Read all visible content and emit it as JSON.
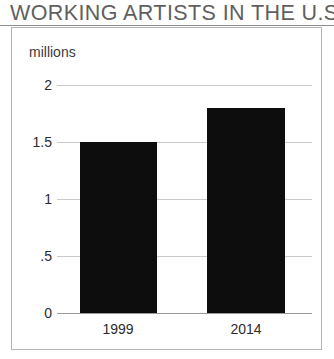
{
  "chart_data": {
    "type": "bar",
    "title": "WORKING ARTISTS IN THE U.S.",
    "subtitle": "",
    "unit_label": "millions",
    "xlabel": "",
    "ylabel": "millions",
    "categories": [
      "1999",
      "2014"
    ],
    "values": [
      1.5,
      1.8
    ],
    "series": [
      {
        "name": "Working artists",
        "values": [
          1.5,
          1.8
        ]
      }
    ],
    "ylim": [
      0,
      2
    ],
    "yticks": [
      2,
      1.5,
      1,
      0.5,
      0
    ],
    "ytick_labels": [
      "2",
      "1.5",
      "1",
      ".5",
      "0"
    ],
    "grid": true,
    "legend": "none",
    "bar_color": "#0d0d0d",
    "grid_color": "#c9c9c9",
    "axis_color": "#9a9a9a",
    "title_color": "#5f5f5f",
    "frame_color": "#b4b4b4",
    "background": "#ffffff"
  },
  "figure": {
    "title": "WORKING ARTISTS IN THE U.S.",
    "unit_caption": "millions",
    "y_labels": [
      "2",
      "1.5",
      "1",
      ".5",
      "0"
    ],
    "x_labels": [
      "1999",
      "2014"
    ]
  }
}
